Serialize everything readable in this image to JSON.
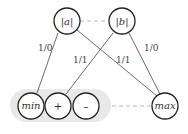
{
  "diagram": {
    "nodes": [
      {
        "id": "abs_a",
        "label": "|a|",
        "style": "italic"
      },
      {
        "id": "abs_b",
        "label": "|b|",
        "style": "italic"
      },
      {
        "id": "min",
        "label": "min",
        "style": "italic"
      },
      {
        "id": "plus",
        "label": "+",
        "style": "normal"
      },
      {
        "id": "minus",
        "label": "–",
        "style": "normal"
      },
      {
        "id": "max",
        "label": "max",
        "style": "italic"
      }
    ],
    "groups": [
      {
        "id": "bottom_group",
        "members": [
          "min",
          "plus",
          "minus"
        ]
      }
    ],
    "edges": [
      {
        "from": "abs_a",
        "to": "min",
        "label": "1/0",
        "type": "solid"
      },
      {
        "from": "abs_a",
        "to": "max",
        "label": "1/1",
        "type": "solid"
      },
      {
        "from": "abs_b",
        "to": "plus",
        "label": "1/1",
        "type": "solid"
      },
      {
        "from": "abs_b",
        "to": "max",
        "label": "1/0",
        "type": "solid"
      },
      {
        "from": "abs_a",
        "to": "abs_b",
        "label": "",
        "type": "dashed"
      },
      {
        "from": "minus",
        "to": "max",
        "label": "",
        "type": "dashed"
      }
    ]
  }
}
